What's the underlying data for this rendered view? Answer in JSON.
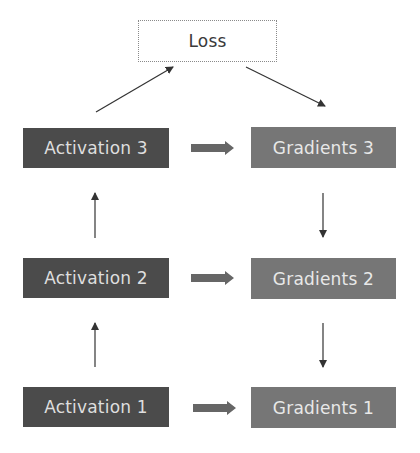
{
  "diagram": {
    "loss": {
      "label": "Loss"
    },
    "activations": [
      {
        "label": "Activation 3"
      },
      {
        "label": "Activation 2"
      },
      {
        "label": "Activation 1"
      }
    ],
    "gradients": [
      {
        "label": "Gradients 3"
      },
      {
        "label": "Gradients 2"
      },
      {
        "label": "Gradients 1"
      }
    ],
    "colors": {
      "activation_fill": "#4b4b4b",
      "gradient_fill": "#767676",
      "arrow": "#333333",
      "block_arrow": "#666666"
    }
  }
}
